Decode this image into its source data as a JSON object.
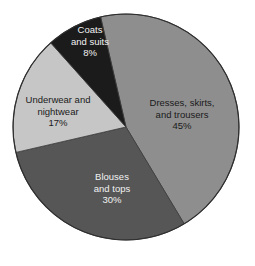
{
  "chart_data": {
    "type": "pie",
    "title": "",
    "start_angle_deg": -13,
    "direction": "clockwise",
    "slices": [
      {
        "label_lines": [
          "Dresses, skirts,",
          "and trousers",
          "45%"
        ],
        "name": "Dresses, skirts, and trousers",
        "value": 45,
        "color": "#8e8e8e",
        "text_color": "#1a1a1a"
      },
      {
        "label_lines": [
          "Blouses",
          "and tops",
          "30%"
        ],
        "name": "Blouses and tops",
        "value": 30,
        "color": "#565656",
        "text_color": "#f2f2f2"
      },
      {
        "label_lines": [
          "Underwear and",
          "nightwear",
          "17%"
        ],
        "name": "Underwear and nightwear",
        "value": 17,
        "color": "#c6c6c6",
        "text_color": "#1a1a1a"
      },
      {
        "label_lines": [
          "Coats",
          "and suits",
          "8%"
        ],
        "name": "Coats and suits",
        "value": 8,
        "color": "#1b1b1b",
        "text_color": "#f2f2f2"
      }
    ],
    "unit": "%"
  }
}
